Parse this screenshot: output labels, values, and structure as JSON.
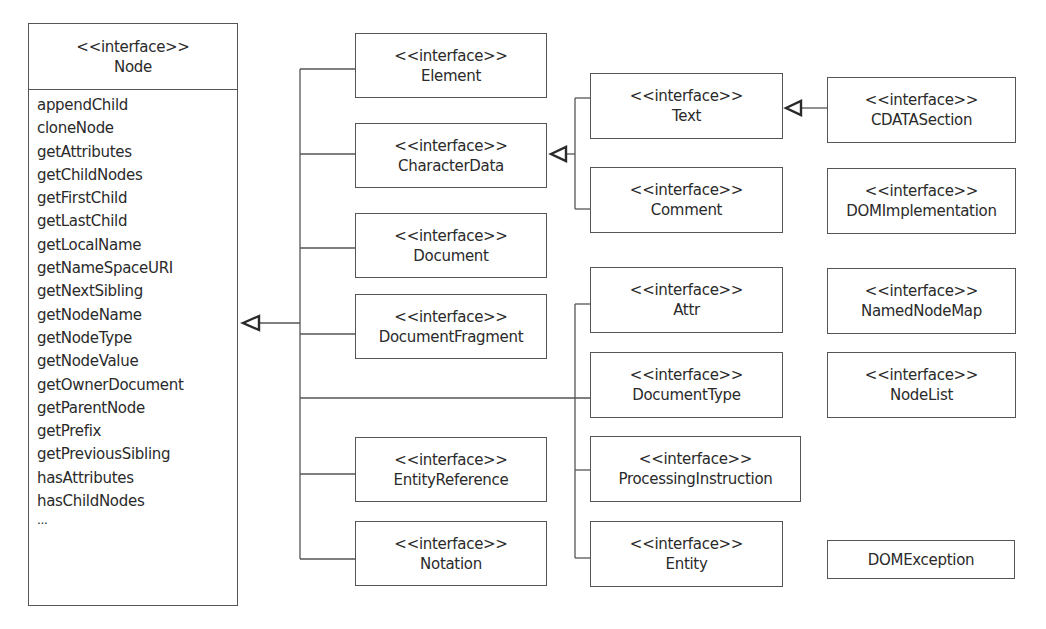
{
  "diagram": {
    "type": "uml-class-diagram",
    "stereotype": "<<interface>>",
    "root": {
      "name": "Node",
      "methods": [
        "appendChild",
        "cloneNode",
        "getAttributes",
        "getChildNodes",
        "getFirstChild",
        "getLastChild",
        "getLocalName",
        "getNameSpaceURI",
        "getNextSibling",
        "getNodeName",
        "getNodeType",
        "getNodeValue",
        "getOwnerDocument",
        "getParentNode",
        "getPrefix",
        "getPreviousSibling",
        "hasAttributes",
        "hasChildNodes",
        "..."
      ]
    },
    "boxes": {
      "element": {
        "name": "Element"
      },
      "characterdata": {
        "name": "CharacterData"
      },
      "document": {
        "name": "Document"
      },
      "documentfragment": {
        "name": "DocumentFragment"
      },
      "entityreference": {
        "name": "EntityReference"
      },
      "notation": {
        "name": "Notation"
      },
      "text": {
        "name": "Text"
      },
      "comment": {
        "name": "Comment"
      },
      "attr": {
        "name": "Attr"
      },
      "documenttype": {
        "name": "DocumentType"
      },
      "processinginstruction": {
        "name": "ProcessingInstruction"
      },
      "entity": {
        "name": "Entity"
      },
      "cdatasection": {
        "name": "CDATASection"
      },
      "domimplementation": {
        "name": "DOMImplementation"
      },
      "namednodemap": {
        "name": "NamedNodeMap"
      },
      "nodelist": {
        "name": "NodeList"
      },
      "domexception": {
        "name": "DOMException"
      }
    },
    "relationships": [
      {
        "from": "Element",
        "to": "Node",
        "type": "generalization"
      },
      {
        "from": "CharacterData",
        "to": "Node",
        "type": "generalization"
      },
      {
        "from": "Document",
        "to": "Node",
        "type": "generalization"
      },
      {
        "from": "DocumentFragment",
        "to": "Node",
        "type": "generalization"
      },
      {
        "from": "EntityReference",
        "to": "Node",
        "type": "generalization"
      },
      {
        "from": "Notation",
        "to": "Node",
        "type": "generalization"
      },
      {
        "from": "Attr",
        "to": "Node",
        "type": "generalization"
      },
      {
        "from": "DocumentType",
        "to": "Node",
        "type": "generalization"
      },
      {
        "from": "ProcessingInstruction",
        "to": "Node",
        "type": "generalization"
      },
      {
        "from": "Entity",
        "to": "Node",
        "type": "generalization"
      },
      {
        "from": "Text",
        "to": "CharacterData",
        "type": "generalization"
      },
      {
        "from": "Comment",
        "to": "CharacterData",
        "type": "generalization"
      },
      {
        "from": "CDATASection",
        "to": "Text",
        "type": "generalization"
      }
    ],
    "colors": {
      "line": "#555555",
      "text": "#2a2a2a",
      "background": "#ffffff"
    }
  }
}
